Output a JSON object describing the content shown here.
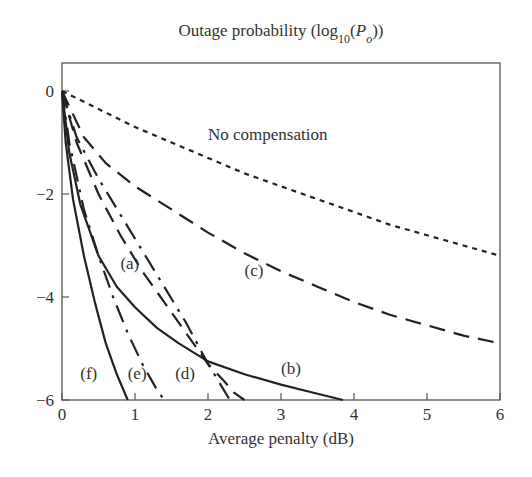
{
  "chart_data": {
    "type": "line",
    "title": "Outage probability (log10(Po))",
    "title_parts": {
      "prefix": "Outage probability (log",
      "sub": "10",
      "mid": "(",
      "var": "P",
      "var_sub": "o",
      "suffix": "))"
    },
    "xlabel": "Average penalty (dB)",
    "ylabel": "",
    "xlim": [
      0,
      6
    ],
    "ylim": [
      -6,
      0.55
    ],
    "xticks": [
      0,
      1,
      2,
      3,
      4,
      5,
      6
    ],
    "xtick_labels": [
      "0",
      "1",
      "2",
      "3",
      "4",
      "5",
      "6"
    ],
    "yticks": [
      0,
      -2,
      -4,
      -6
    ],
    "ytick_labels": [
      "0",
      "−2",
      "−4",
      "−6"
    ],
    "grid": false,
    "legend": "none (inline annotations)",
    "series": [
      {
        "name": "No compensation",
        "style": "short-dash",
        "x": [
          0,
          0.5,
          1,
          1.5,
          2,
          2.5,
          3,
          3.5,
          4,
          4.5,
          5,
          5.5,
          6
        ],
        "y": [
          0,
          -0.35,
          -0.7,
          -1.0,
          -1.3,
          -1.6,
          -1.85,
          -2.1,
          -2.35,
          -2.6,
          -2.8,
          -3.0,
          -3.2
        ]
      },
      {
        "name": "(c)",
        "style": "long-dash",
        "x": [
          0,
          0.3,
          0.6,
          1,
          1.5,
          2,
          2.5,
          3,
          3.5,
          4,
          4.5,
          5,
          5.5,
          6
        ],
        "y": [
          0,
          -0.9,
          -1.4,
          -1.85,
          -2.3,
          -2.75,
          -3.15,
          -3.5,
          -3.8,
          -4.1,
          -4.35,
          -4.55,
          -4.75,
          -4.9
        ]
      },
      {
        "name": "(a)",
        "style": "dash-dot",
        "x": [
          0,
          0.2,
          0.5,
          0.8,
          1.1,
          1.4,
          1.7,
          2.0,
          2.3
        ],
        "y": [
          0,
          -0.9,
          -1.7,
          -2.4,
          -3.1,
          -3.8,
          -4.5,
          -5.3,
          -6
        ]
      },
      {
        "name": "(b)",
        "style": "solid",
        "x": [
          0,
          0.1,
          0.25,
          0.5,
          0.75,
          1.0,
          1.3,
          1.6,
          2.0,
          2.5,
          3.0,
          3.5,
          3.85
        ],
        "y": [
          0,
          -1.2,
          -2.2,
          -3.2,
          -3.8,
          -4.2,
          -4.6,
          -4.9,
          -5.25,
          -5.5,
          -5.7,
          -5.88,
          -6
        ]
      },
      {
        "name": "(d)",
        "style": "long-dash",
        "x": [
          0,
          0.2,
          0.5,
          0.8,
          1.1,
          1.4,
          1.7,
          2.0,
          2.2,
          2.35,
          2.5
        ],
        "y": [
          0,
          -1.0,
          -2.0,
          -2.8,
          -3.5,
          -4.1,
          -4.7,
          -5.3,
          -5.6,
          -5.85,
          -6
        ]
      },
      {
        "name": "(e)",
        "style": "dash-dot",
        "x": [
          0,
          0.1,
          0.3,
          0.5,
          0.7,
          0.9,
          1.1,
          1.3,
          1.4
        ],
        "y": [
          0,
          -1.0,
          -2.3,
          -3.2,
          -4.0,
          -4.7,
          -5.3,
          -5.8,
          -6
        ]
      },
      {
        "name": "(f)",
        "style": "solid",
        "x": [
          0,
          0.05,
          0.15,
          0.3,
          0.45,
          0.6,
          0.75,
          0.9
        ],
        "y": [
          0,
          -1.0,
          -2.1,
          -3.2,
          -4.1,
          -4.9,
          -5.5,
          -6
        ]
      }
    ],
    "annotations": [
      {
        "text": "No compensation",
        "x": 2.0,
        "y": -0.95
      },
      {
        "text": "(a)",
        "x": 0.8,
        "y": -3.45
      },
      {
        "text": "(b)",
        "x": 3.0,
        "y": -5.5
      },
      {
        "text": "(c)",
        "x": 2.5,
        "y": -3.6
      },
      {
        "text": "(d)",
        "x": 1.55,
        "y": -5.6
      },
      {
        "text": "(e)",
        "x": 0.9,
        "y": -5.6
      },
      {
        "text": "(f)",
        "x": 0.25,
        "y": -5.6
      }
    ]
  }
}
